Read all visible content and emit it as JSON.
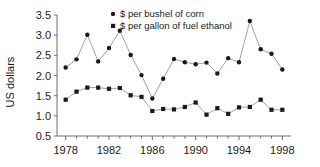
{
  "chart_data": {
    "type": "line",
    "title": "",
    "xlabel": "",
    "ylabel": "US dollars",
    "xlim": [
      1977.2,
      1998.8
    ],
    "ylim": [
      0.5,
      3.5
    ],
    "yticks": [
      "0.5",
      "1.0",
      "1.5",
      "2.0",
      "2.5",
      "3.0",
      "3.5"
    ],
    "ytick_values": [
      0.5,
      1.0,
      1.5,
      2.0,
      2.5,
      3.0,
      3.5
    ],
    "xticks": [
      "1978",
      "1982",
      "1986",
      "1990",
      "1994",
      "1998"
    ],
    "xtick_values": [
      1978,
      1982,
      1986,
      1990,
      1994,
      1998
    ],
    "x_minor_step": 1,
    "grid": false,
    "legend_position": "top-center",
    "x": [
      1978,
      1979,
      1980,
      1981,
      1982,
      1983,
      1984,
      1985,
      1986,
      1987,
      1988,
      1989,
      1990,
      1991,
      1992,
      1993,
      1994,
      1995,
      1996,
      1997,
      1998
    ],
    "series": [
      {
        "name": "$ per bushel of corn",
        "marker": "circle",
        "color": "#1a1a1a",
        "values": [
          2.2,
          2.4,
          3.01,
          2.35,
          2.68,
          3.11,
          2.51,
          2.01,
          1.43,
          1.92,
          2.41,
          2.33,
          2.28,
          2.32,
          2.05,
          2.43,
          2.33,
          3.35,
          2.65,
          2.54,
          2.15
        ]
      },
      {
        "name": "$ per gallon of fuel ethanol",
        "marker": "square",
        "color": "#1a1a1a",
        "values": [
          1.4,
          1.6,
          1.7,
          1.7,
          1.67,
          1.69,
          1.51,
          1.47,
          1.12,
          1.17,
          1.16,
          1.22,
          1.33,
          1.03,
          1.19,
          1.05,
          1.21,
          1.22,
          1.4,
          1.15,
          1.15
        ]
      }
    ]
  }
}
